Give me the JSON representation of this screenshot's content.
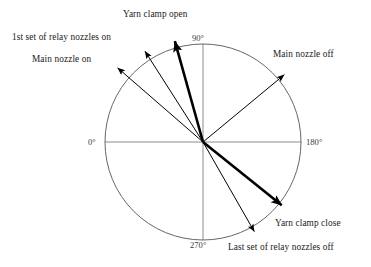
{
  "figure": {
    "type": "polar-timing-diagram",
    "background_color": "#ffffff",
    "circle": {
      "center_x": 203,
      "center_y": 142,
      "radius": 98,
      "stroke_color": "#555555",
      "stroke_width": 0.9
    },
    "axes": {
      "stroke_color": "#808080",
      "stroke_width": 0.9,
      "labels": [
        {
          "text": "0°",
          "x": 88,
          "y": 137,
          "position": "left"
        },
        {
          "text": "90°",
          "x": 192,
          "y": 33,
          "position": "top"
        },
        {
          "text": "180°",
          "x": 306,
          "y": 137,
          "position": "right"
        },
        {
          "text": "270°",
          "x": 190,
          "y": 240,
          "position": "bottom"
        }
      ]
    },
    "events": [
      {
        "id": "yarn-clamp-open",
        "label": "Yarn clamp open",
        "weight": "thick",
        "stroke_width": 2.6,
        "color": "#000000",
        "tip_x": 172,
        "tip_y": 31,
        "label_x": 123,
        "label_y": 9,
        "label_align": "left"
      },
      {
        "id": "first-set-relay-nozzles-on",
        "label": "1st set of relay nozzles on",
        "weight": "thin",
        "stroke_width": 1.0,
        "color": "#000000",
        "tip_x": 141,
        "tip_y": 45,
        "label_x": 12,
        "label_y": 32,
        "label_align": "left"
      },
      {
        "id": "main-nozzle-on",
        "label": "Main nozzle on",
        "weight": "thin",
        "stroke_width": 1.0,
        "color": "#000000",
        "tip_x": 112,
        "tip_y": 63,
        "label_x": 32,
        "label_y": 54,
        "label_align": "left"
      },
      {
        "id": "main-nozzle-off",
        "label": "Main nozzle off",
        "weight": "thin",
        "stroke_width": 1.0,
        "color": "#000000",
        "tip_x": 290,
        "tip_y": 70,
        "label_x": 273,
        "label_y": 49,
        "label_align": "left"
      },
      {
        "id": "yarn-clamp-close",
        "label": "Yarn clamp close",
        "weight": "thick",
        "stroke_width": 2.6,
        "color": "#000000",
        "tip_x": 290,
        "tip_y": 212,
        "label_x": 275,
        "label_y": 218,
        "label_align": "left"
      },
      {
        "id": "last-set-relay-nozzles-off",
        "label": "Last set of relay nozzles off",
        "weight": "thin",
        "stroke_width": 1.0,
        "color": "#000000",
        "tip_x": 258,
        "tip_y": 238,
        "label_x": 228,
        "label_y": 242,
        "label_align": "left"
      }
    ]
  },
  "chart_data": {
    "type": "scatter",
    "title": "",
    "subtitle": "",
    "xlabel": "",
    "ylabel": "",
    "grid": false,
    "legend_position": "none",
    "coordinate_system": "polar",
    "angle_unit": "degrees",
    "angle_direction": "counterclockwise-from-left",
    "axis_tick_labels": [
      "0°",
      "90°",
      "180°",
      "270°"
    ],
    "annotations": [
      "Yarn clamp open",
      "1st set of relay nozzles on",
      "Main nozzle on",
      "Main nozzle off",
      "Yarn clamp close",
      "Last set of relay nozzles off"
    ],
    "series": [
      {
        "name": "Air-jet loom weft insertion timing events",
        "points": [
          {
            "label": "Yarn clamp open",
            "angle_deg": 74,
            "emphasis": "thick"
          },
          {
            "label": "1st set of relay nozzles on",
            "angle_deg": 55,
            "emphasis": "thin"
          },
          {
            "label": "Main nozzle on",
            "angle_deg": 39,
            "emphasis": "thin"
          },
          {
            "label": "Main nozzle off",
            "angle_deg": 143,
            "emphasis": "thin"
          },
          {
            "label": "Yarn clamp close",
            "angle_deg": 219,
            "emphasis": "thick"
          },
          {
            "label": "Last set of relay nozzles off",
            "angle_deg": 242,
            "emphasis": "thin"
          }
        ]
      }
    ]
  }
}
